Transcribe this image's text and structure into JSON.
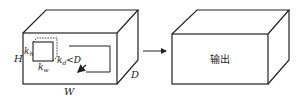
{
  "diagram": {
    "input_volume": {
      "labels": {
        "height": "H",
        "width": "W",
        "depth": "D"
      },
      "kernel": {
        "height_label_base": "k",
        "height_label_sub": "h",
        "width_label_base": "k",
        "width_label_sub": "w",
        "depth_label_base": "k",
        "depth_label_sub": "d",
        "depth_constraint": "<D"
      }
    },
    "arrow": {
      "direction": "right"
    },
    "output_volume": {
      "label": "输出"
    },
    "colors": {
      "stroke": "#222222",
      "background": "#ffffff"
    }
  }
}
